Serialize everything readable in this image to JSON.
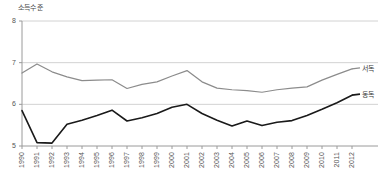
{
  "chart_data": {
    "type": "line",
    "title": "",
    "ylabel": "소득수준",
    "xlabel": "",
    "ylim": [
      5,
      8
    ],
    "yticks": [
      5,
      6,
      7,
      8
    ],
    "grid": true,
    "legend_position": "right-inline",
    "categories": [
      1990,
      1991,
      1992,
      1993,
      1994,
      1995,
      1996,
      1997,
      1998,
      1999,
      2000,
      2001,
      2002,
      2003,
      2004,
      2005,
      2006,
      2007,
      2008,
      2009,
      2010,
      2011,
      2012
    ],
    "series": [
      {
        "name": "서독",
        "color": "#8c8c8c",
        "values": [
          6.75,
          6.97,
          6.78,
          6.66,
          6.57,
          6.58,
          6.59,
          6.38,
          6.48,
          6.54,
          6.68,
          6.81,
          6.54,
          6.39,
          6.35,
          6.33,
          6.29,
          6.35,
          6.39,
          6.42,
          6.58,
          6.72,
          6.85
        ]
      },
      {
        "name": "동독",
        "color": "#1a1a1a",
        "values": [
          5.85,
          5.08,
          5.07,
          5.52,
          5.62,
          5.73,
          5.86,
          5.6,
          5.68,
          5.78,
          5.93,
          6.0,
          5.78,
          5.62,
          5.48,
          5.6,
          5.49,
          5.57,
          5.61,
          5.73,
          5.88,
          6.04,
          6.22
        ]
      }
    ]
  }
}
